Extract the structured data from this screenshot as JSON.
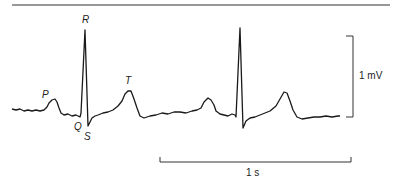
{
  "figure": {
    "wave_labels": {
      "P": "P",
      "Q": "Q",
      "R": "R",
      "S": "S",
      "T": "T"
    },
    "voltage_scale_label": "1 mV",
    "time_scale_label": "1 s",
    "colors": {
      "trace": "#1a1a1a",
      "rule": "#333333"
    }
  }
}
